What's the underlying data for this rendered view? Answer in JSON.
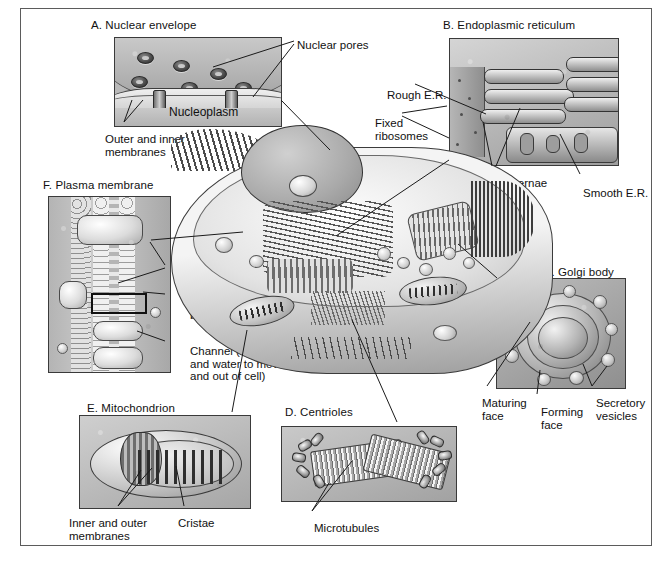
{
  "figure": {
    "caption": "",
    "panels": [
      {
        "id": "A",
        "title": "A. Nuclear envelope",
        "labels": [
          "Nuclear pores",
          "Nucleoplasm",
          "Outer and inner\nmembranes"
        ]
      },
      {
        "id": "B",
        "title": "B. Endoplasmic reticulum",
        "labels": [
          "Rough E.R.",
          "Fixed\nribosomes",
          "Cisternae",
          "Smooth E.R."
        ]
      },
      {
        "id": "C",
        "title": "C. Golgi body",
        "labels": [
          "Maturing\nface",
          "Forming\nface",
          "Secretory\nvesicles"
        ]
      },
      {
        "id": "D",
        "title": "D. Centrioles",
        "labels": [
          "Microtubules"
        ]
      },
      {
        "id": "E",
        "title": "E. Mitochondrion",
        "labels": [
          "Inner and outer\nmembranes",
          "Cristae"
        ]
      },
      {
        "id": "F",
        "title": "F. Plasma membrane",
        "labels": [
          "Proteins",
          "Phospholipid\nbilayer",
          "Channel (allows ions\nand water to move in\nand out of cell)"
        ]
      }
    ]
  },
  "panel_a": {
    "title": "A. Nuclear envelope",
    "nuclear_pores": "Nuclear pores",
    "nucleoplasm": "Nucleoplasm",
    "membranes": "Outer and inner\nmembranes"
  },
  "panel_b": {
    "title": "B. Endoplasmic reticulum",
    "rough_er": "Rough E.R.",
    "fixed_ribosomes": "Fixed\nribosomes",
    "cisternae": "Cisternae",
    "smooth_er": "Smooth E.R."
  },
  "panel_c": {
    "title": "C. Golgi body",
    "maturing_face": "Maturing\nface",
    "forming_face": "Forming\nface",
    "secretory_vesicles": "Secretory\nvesicles"
  },
  "panel_d": {
    "title": "D. Centrioles",
    "microtubules": "Microtubules"
  },
  "panel_e": {
    "title": "E. Mitochondrion",
    "membranes": "Inner and outer\nmembranes",
    "cristae": "Cristae"
  },
  "panel_f": {
    "title": "F. Plasma membrane",
    "proteins": "Proteins",
    "phospholipid_bilayer": "Phospholipid\nbilayer",
    "channel": "Channel (allows ions\nand water to move in\nand out of cell)"
  },
  "colors": {
    "frame_border": "#5b5b5b",
    "panel_border": "#3a3a3a",
    "panel_fill": "#b9b9b9",
    "text": "#111111",
    "leader_line": "#1a1a1a",
    "page_background": "#ffffff"
  }
}
